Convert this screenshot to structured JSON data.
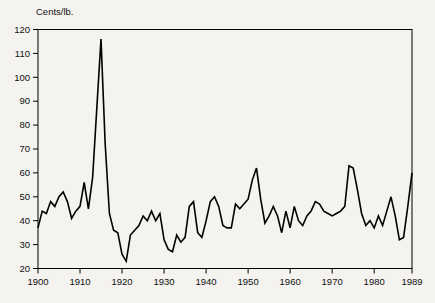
{
  "chart": {
    "title": "Cents/lb.",
    "colors": {
      "background": "#f4f3ef",
      "line": "#000000",
      "frame": "#000000",
      "text": "#111111"
    }
  },
  "chart_data": {
    "type": "line",
    "title": "Cents/lb.",
    "xlabel": "",
    "ylabel": "Cents/lb.",
    "grid": false,
    "legend": "none",
    "x_range": [
      1900,
      1989
    ],
    "ylim": [
      20,
      120
    ],
    "y_ticks": [
      20,
      30,
      40,
      50,
      60,
      70,
      80,
      90,
      100,
      110,
      120
    ],
    "y_tick_labels": [
      "20",
      "30",
      "40",
      "50",
      "60",
      "70",
      "80",
      "90",
      "100",
      "110",
      "120"
    ],
    "x_tick_years": [
      1900,
      1910,
      1920,
      1930,
      1940,
      1950,
      1960,
      1970,
      1980,
      1989
    ],
    "x_tick_labels": [
      "1900",
      "1910",
      "1920",
      "1930",
      "1940",
      "1950",
      "1960",
      "1970",
      "1980",
      "1989"
    ],
    "series": [
      {
        "name": "Price (cents per pound)",
        "x": [
          1900,
          1901,
          1902,
          1903,
          1904,
          1905,
          1906,
          1907,
          1908,
          1909,
          1910,
          1911,
          1912,
          1913,
          1914,
          1915,
          1916,
          1917,
          1918,
          1919,
          1920,
          1921,
          1922,
          1923,
          1924,
          1925,
          1926,
          1927,
          1928,
          1929,
          1930,
          1931,
          1932,
          1933,
          1934,
          1935,
          1936,
          1937,
          1938,
          1939,
          1940,
          1941,
          1942,
          1943,
          1944,
          1945,
          1946,
          1947,
          1948,
          1949,
          1950,
          1951,
          1952,
          1953,
          1954,
          1955,
          1956,
          1957,
          1958,
          1959,
          1960,
          1961,
          1962,
          1963,
          1964,
          1965,
          1966,
          1967,
          1968,
          1969,
          1970,
          1971,
          1972,
          1973,
          1974,
          1975,
          1976,
          1977,
          1978,
          1979,
          1980,
          1981,
          1982,
          1983,
          1984,
          1985,
          1986,
          1987,
          1988,
          1989
        ],
        "values": [
          37,
          44,
          43,
          48,
          46,
          50,
          52,
          48,
          41,
          44,
          46,
          56,
          45,
          58,
          87,
          116,
          72,
          43,
          36,
          35,
          26,
          23,
          34,
          36,
          38,
          42,
          40,
          44,
          40,
          43,
          32,
          28,
          27,
          34,
          31,
          33,
          46,
          48,
          35,
          33,
          40,
          48,
          50,
          46,
          38,
          37,
          37,
          47,
          45,
          47,
          49,
          57,
          62,
          49,
          39,
          42,
          46,
          42,
          35,
          44,
          37,
          46,
          40,
          38,
          42,
          44,
          48,
          47,
          44,
          43,
          42,
          43,
          44,
          46,
          63,
          62,
          53,
          43,
          38,
          40,
          37,
          42,
          38,
          44,
          50,
          42,
          32,
          33,
          46,
          60
        ]
      }
    ]
  }
}
